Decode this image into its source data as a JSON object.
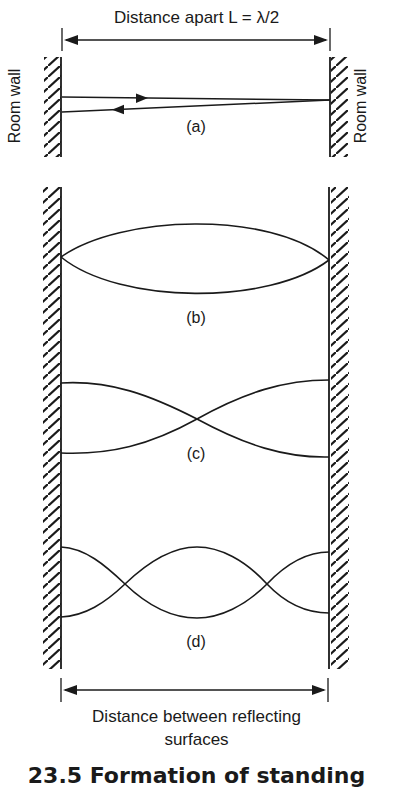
{
  "diagram": {
    "top_dimension_label": "Distance apart L = λ/2",
    "wall_label_left": "Room wall",
    "wall_label_right": "Room wall",
    "panels": [
      {
        "id": "a",
        "label": "(a)",
        "content": "incident and reflected ray between walls"
      },
      {
        "id": "b",
        "label": "(b)",
        "content": "standing wave, one loop (fundamental)"
      },
      {
        "id": "c",
        "label": "(c)",
        "content": "standing wave, one crossing node"
      },
      {
        "id": "d",
        "label": "(d)",
        "content": "standing wave, two crossing nodes"
      }
    ],
    "bottom_dimension_label_line1": "Distance between reflecting",
    "bottom_dimension_label_line2": "surfaces",
    "figure_caption_partial": "23.5 Formation of standing"
  },
  "colors": {
    "ink": "#1a1a1a",
    "background": "#ffffff"
  }
}
